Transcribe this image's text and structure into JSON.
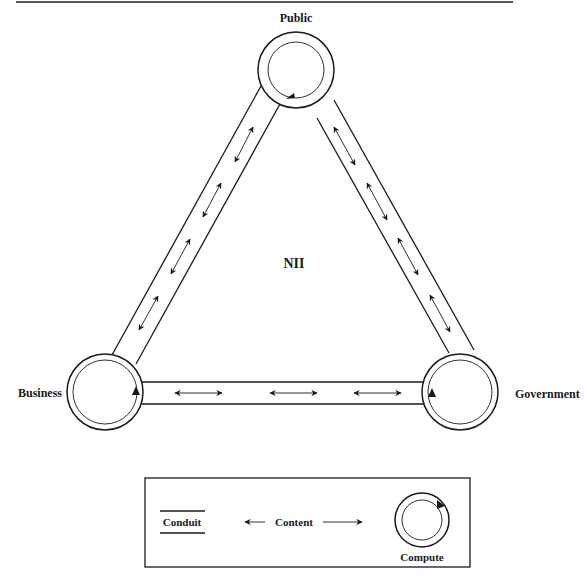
{
  "diagram": {
    "title": "NII",
    "nodes": [
      {
        "id": "public",
        "label": "Public"
      },
      {
        "id": "business",
        "label": "Business"
      },
      {
        "id": "government",
        "label": "Government"
      }
    ],
    "edges": [
      {
        "from": "public",
        "to": "business",
        "type": "conduit",
        "content_arrows": 4,
        "bidirectional": true
      },
      {
        "from": "public",
        "to": "government",
        "type": "conduit",
        "content_arrows": 4,
        "bidirectional": true
      },
      {
        "from": "business",
        "to": "government",
        "type": "conduit",
        "content_arrows": 3,
        "bidirectional": true
      }
    ],
    "legend": {
      "conduit_label": "Conduit",
      "content_label": "Content",
      "compute_label": "Compute"
    },
    "colors": {
      "stroke": "#1a1a1a",
      "background": "#ffffff",
      "rule": "#555555"
    }
  }
}
